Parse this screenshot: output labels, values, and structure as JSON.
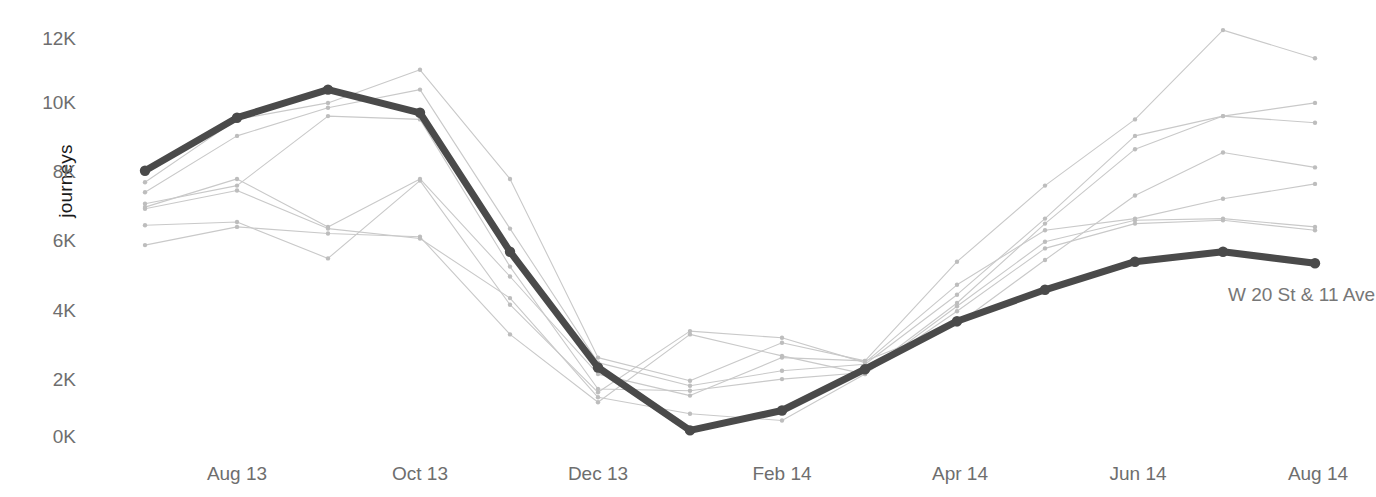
{
  "axis": {
    "ylabel": "journeys",
    "yticks": [
      "12K",
      "10K",
      "8K",
      "6K",
      "4K",
      "2K",
      "0K"
    ],
    "xticks": [
      "Aug 13",
      "Oct 13",
      "Dec 13",
      "Feb 14",
      "Apr 14",
      "Jun 14",
      "Aug 14"
    ]
  },
  "annotations": [
    {
      "text": "W 20 St & 11 Ave",
      "x": 1228,
      "y": 284
    }
  ],
  "style": {
    "highlight_color": "#4a4a4a",
    "context_color": "#c9c9c9",
    "tick_color": "#6e6e6e",
    "axis_label_color": "#1a1a1a",
    "background": "#ffffff"
  },
  "chart_data": {
    "type": "line",
    "title": "",
    "xlabel": "",
    "ylabel": "journeys",
    "ylim": [
      0,
      12600
    ],
    "xlim": [
      "Jul 13",
      "Aug 14"
    ],
    "grid": false,
    "legend": "none",
    "x": [
      "Jul 13",
      "Aug 13",
      "Sep 13",
      "Oct 13",
      "Nov 13",
      "Dec 13",
      "Jan 14",
      "Feb 14",
      "Mar 14",
      "Apr 14",
      "May 14",
      "Jun 14",
      "Jul 14",
      "Aug 14"
    ],
    "x_pixels": [
      145,
      237,
      328,
      420,
      510,
      598,
      690,
      782,
      865,
      957,
      1045,
      1135,
      1223,
      1315
    ],
    "highlight_series": {
      "name": "W 20 St & 11 Ave",
      "color": "#4a4a4a",
      "values": [
        8050,
        9650,
        10500,
        9800,
        5600,
        2100,
        200,
        800,
        2050,
        3500,
        4450,
        5300,
        5600,
        5250
      ]
    },
    "context_series": [
      {
        "name": "station-2",
        "color": "#c9c9c9",
        "values": [
          7700,
          9600,
          10100,
          11100,
          7800,
          2400,
          1700,
          2850,
          2300,
          5300,
          7600,
          9600,
          12300,
          11450
        ]
      },
      {
        "name": "station-3",
        "color": "#c9c9c9",
        "values": [
          7400,
          9100,
          9950,
          10500,
          6300,
          2250,
          1550,
          2000,
          2200,
          4300,
          6600,
          9100,
          9700,
          10100
        ]
      },
      {
        "name": "station-4",
        "color": "#c9c9c9",
        "values": [
          7050,
          7600,
          9700,
          9600,
          5150,
          1450,
          1400,
          1750,
          1950,
          4050,
          6450,
          8700,
          9700,
          9500
        ]
      },
      {
        "name": "station-5",
        "color": "#c9c9c9",
        "values": [
          6950,
          7800,
          6350,
          7800,
          4850,
          1900,
          1250,
          2400,
          2300,
          3400,
          5350,
          7300,
          8600,
          8150
        ]
      },
      {
        "name": "station-6",
        "color": "#c9c9c9",
        "values": [
          6400,
          6500,
          5400,
          7750,
          4000,
          1350,
          3200,
          3000,
          2250,
          4600,
          6250,
          6600,
          7200,
          7650
        ]
      },
      {
        "name": "station-7",
        "color": "#c9c9c9",
        "values": [
          5800,
          6350,
          6150,
          6050,
          3100,
          1050,
          3100,
          2450,
          1900,
          3950,
          5900,
          6550,
          6600,
          6350
        ]
      },
      {
        "name": "station-8",
        "color": "#c9c9c9",
        "values": [
          6900,
          7450,
          6300,
          6000,
          4200,
          1200,
          700,
          500,
          1900,
          3800,
          5700,
          6450,
          6550,
          6250
        ]
      }
    ]
  }
}
